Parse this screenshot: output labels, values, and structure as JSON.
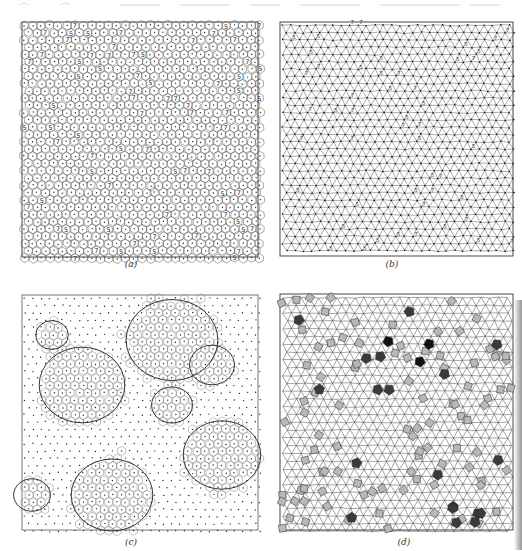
{
  "figure": {
    "panels": [
      {
        "id": "a",
        "caption": "(a)",
        "description": "Voronoi tessellation of particle configuration; cells with 5 or 7 neighbours labelled",
        "defect_labels": [
          "5",
          "7"
        ]
      },
      {
        "id": "b",
        "caption": "(b)",
        "description": "Delaunay triangulation of the same configuration with 5/7 defect sites marked",
        "defect_labels": [
          "5",
          "7"
        ]
      },
      {
        "id": "c",
        "caption": "(c)",
        "description": "Particles shown as dots; ordered crystalline clusters outlined with Voronoi cells"
      },
      {
        "id": "d",
        "caption": "(d)",
        "description": "Triangle-square tiling; squares shaded light grey, irregular polygons shaded dark grey"
      }
    ],
    "colors": {
      "line": "#333333",
      "square_fill": "#b8b8b8",
      "defect_fill": "#3a3a3a",
      "darkest_fill": "#111111",
      "background": "#ffffff"
    }
  }
}
